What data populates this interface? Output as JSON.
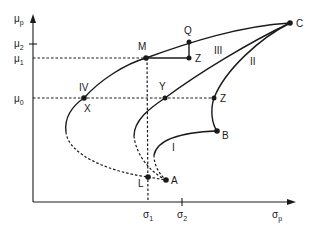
{
  "diagram": {
    "axes": {
      "y_label": "μ",
      "y_label_sub": "p",
      "x_label": "σ",
      "x_label_sub": "p",
      "y_ticks": [
        {
          "base": "μ",
          "sub": "2"
        },
        {
          "base": "μ",
          "sub": "1"
        },
        {
          "base": "μ",
          "sub": "0"
        }
      ],
      "x_ticks": [
        {
          "base": "σ",
          "sub": "1"
        },
        {
          "base": "σ",
          "sub": "2"
        }
      ]
    },
    "curves": {
      "I": "I",
      "II": "II",
      "III": "III",
      "IV": "IV"
    },
    "points": {
      "C": "C",
      "M": "M",
      "Q": "Q",
      "Z_upper": "Z",
      "Y": "Y",
      "Z_mid": "Z",
      "X": "X",
      "B": "B",
      "L": "L",
      "A": "A"
    }
  }
}
